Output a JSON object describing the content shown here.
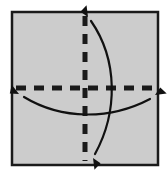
{
  "figure": {
    "caption": "Square sheet with vertical and horizontal dashed fold lines and two curved double-headed fold arrows",
    "type": "origami-fold-diagram",
    "canvas": {
      "width": 167,
      "height": 173,
      "background": "#ffffff"
    }
  },
  "colors": {
    "page_background": "#ffffff",
    "sheet_fill": "#cccccc",
    "sheet_border": "#1a1a1a",
    "fold_line": "#1a1a1a",
    "arrow": "#111111"
  },
  "sheet": {
    "label": "paper-sheet",
    "x": 12,
    "y": 12,
    "width": 146,
    "height": 153,
    "fill": "#cccccc",
    "stroke": "#1a1a1a",
    "stroke_width": 2.5
  },
  "fold_lines": [
    {
      "name": "vertical-fold-line",
      "orientation": "vertical",
      "x1": 85,
      "y1": 16,
      "x2": 85,
      "y2": 161,
      "stroke": "#1a1a1a",
      "stroke_width": 5,
      "dash": "10 8"
    },
    {
      "name": "horizontal-fold-line",
      "orientation": "horizontal",
      "x1": 16,
      "y1": 88,
      "x2": 154,
      "y2": 88,
      "stroke": "#1a1a1a",
      "stroke_width": 5,
      "dash": "10 8"
    }
  ],
  "fold_arrows": [
    {
      "name": "vertical-fold-arrow",
      "description": "Curved arrow bowing right, arrowheads at top and bottom of the vertical fold line",
      "path": "M 91 21 C 118 60, 118 112, 95 154",
      "stroke": "#111111",
      "stroke_width": 2.2,
      "heads": [
        {
          "name": "arrowhead-top",
          "x": 88,
          "y": 17,
          "angle": -118
        },
        {
          "name": "arrowhead-bottom",
          "x": 93,
          "y": 158,
          "angle": 62
        }
      ]
    },
    {
      "name": "horizontal-fold-arrow",
      "description": "Curved arrow bowing downward, arrowheads at left and right of the horizontal fold line",
      "path": "M 24 97 C 62 120, 110 120, 150 99",
      "stroke": "#111111",
      "stroke_width": 2.2,
      "heads": [
        {
          "name": "arrowhead-left",
          "x": 19,
          "y": 94,
          "angle": 211
        },
        {
          "name": "arrowhead-right",
          "x": 155,
          "y": 95,
          "angle": -28
        }
      ]
    }
  ]
}
